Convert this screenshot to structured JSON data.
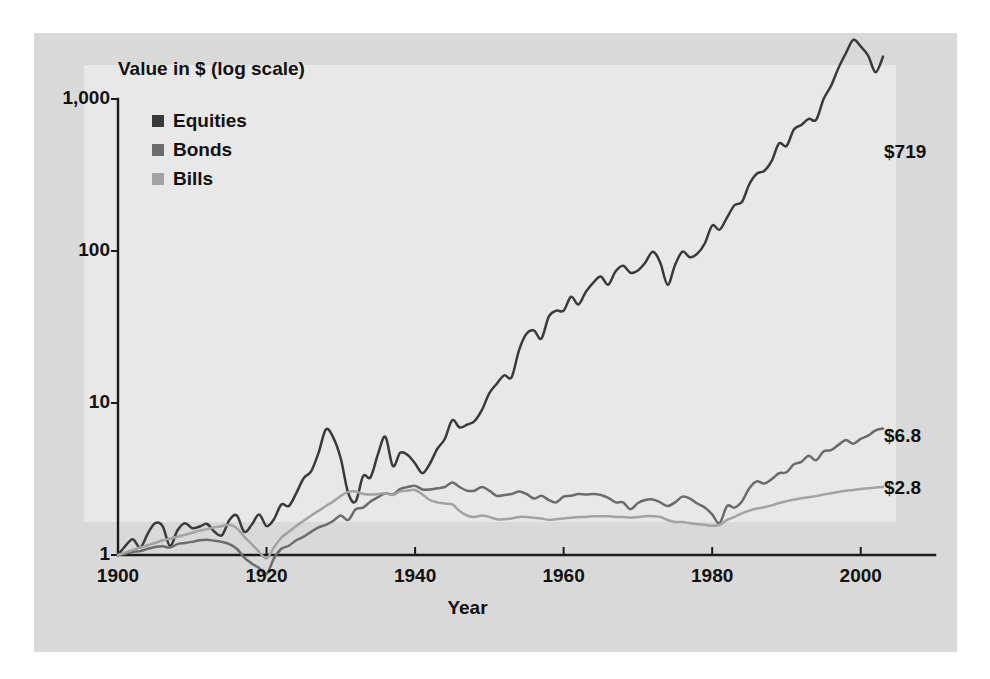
{
  "chart_data": {
    "type": "line",
    "title": "",
    "subtitle": "",
    "ylabel": "Value in $ (log scale)",
    "xlabel": "Year",
    "yscale": "log",
    "ylim": [
      1,
      1000
    ],
    "xlim": [
      1900,
      2010
    ],
    "grid": false,
    "legend_position": "top-left",
    "ytick_labels": [
      "1,000",
      "100",
      "10",
      "1"
    ],
    "ytick_values": [
      1000,
      100,
      10,
      1
    ],
    "xtick_labels": [
      "1900",
      "1920",
      "1940",
      "1960",
      "1980",
      "2000"
    ],
    "xtick_values": [
      1900,
      1920,
      1940,
      1960,
      1980,
      2000
    ],
    "annotations": [
      {
        "text": "$719",
        "series": "Equities",
        "x": 2003,
        "y": 719
      },
      {
        "text": "$6.8",
        "series": "Bonds",
        "x": 2003,
        "y": 6.8
      },
      {
        "text": "$2.8",
        "series": "Bills",
        "x": 2003,
        "y": 2.8
      }
    ],
    "colors": {
      "equities": "#3a3a3a",
      "bonds": "#6b6b6b",
      "bills": "#a3a3a3",
      "figure_background": "#d9d9d9",
      "plot_background": "#e8e8e8",
      "axis": "#1b1b1b",
      "text": "#111111"
    },
    "x": [
      1900,
      1901,
      1902,
      1903,
      1904,
      1905,
      1906,
      1907,
      1908,
      1909,
      1910,
      1911,
      1912,
      1913,
      1914,
      1915,
      1916,
      1917,
      1918,
      1919,
      1920,
      1921,
      1922,
      1923,
      1924,
      1925,
      1926,
      1927,
      1928,
      1929,
      1930,
      1931,
      1932,
      1933,
      1934,
      1935,
      1936,
      1937,
      1938,
      1939,
      1940,
      1941,
      1942,
      1943,
      1944,
      1945,
      1946,
      1947,
      1948,
      1949,
      1950,
      1951,
      1952,
      1953,
      1954,
      1955,
      1956,
      1957,
      1958,
      1959,
      1960,
      1961,
      1962,
      1963,
      1964,
      1965,
      1966,
      1967,
      1968,
      1969,
      1970,
      1971,
      1972,
      1973,
      1974,
      1975,
      1976,
      1977,
      1978,
      1979,
      1980,
      1981,
      1982,
      1983,
      1984,
      1985,
      1986,
      1987,
      1988,
      1989,
      1990,
      1991,
      1992,
      1993,
      1994,
      1995,
      1996,
      1997,
      1998,
      1999,
      2000,
      2001,
      2002,
      2003
    ],
    "series": [
      {
        "name": "Equities",
        "color": "#3a3a3a",
        "end_value": 719,
        "values": [
          1.0,
          1.15,
          1.27,
          1.12,
          1.38,
          1.62,
          1.55,
          1.15,
          1.45,
          1.62,
          1.5,
          1.54,
          1.6,
          1.42,
          1.35,
          1.7,
          1.82,
          1.42,
          1.58,
          1.85,
          1.55,
          1.72,
          2.15,
          2.1,
          2.55,
          3.2,
          3.55,
          4.7,
          6.7,
          5.9,
          4.3,
          2.55,
          2.25,
          3.3,
          3.25,
          4.6,
          6.0,
          3.85,
          4.7,
          4.55,
          4.0,
          3.45,
          4.0,
          5.0,
          5.8,
          7.7,
          6.9,
          7.2,
          7.6,
          9.0,
          11.6,
          13.4,
          15.2,
          14.8,
          22.3,
          28.5,
          30.0,
          26.5,
          37.0,
          40.5,
          40.5,
          50.0,
          44.5,
          54.0,
          62.0,
          68.0,
          60.0,
          73.5,
          80.0,
          72.0,
          74.5,
          84.0,
          99.0,
          84.0,
          60.0,
          81.0,
          99.0,
          91.0,
          96.0,
          112.0,
          147.0,
          138.0,
          166.0,
          200.0,
          210.0,
          275.0,
          322.0,
          336.0,
          390.0,
          510.0,
          490.0,
          630.0,
          675.0,
          740.0,
          730.0,
          1000.0,
          1220.0,
          1600.0,
          2000.0,
          2450.0,
          2220.0,
          1930.0,
          1500.0,
          1900.0
        ]
      },
      {
        "name": "Bonds",
        "color": "#6b6b6b",
        "end_value": 6.8,
        "values": [
          1.0,
          1.02,
          1.05,
          1.06,
          1.1,
          1.13,
          1.14,
          1.12,
          1.18,
          1.2,
          1.22,
          1.25,
          1.26,
          1.24,
          1.22,
          1.18,
          1.1,
          0.96,
          0.88,
          0.82,
          0.75,
          0.95,
          1.1,
          1.15,
          1.25,
          1.32,
          1.42,
          1.52,
          1.58,
          1.68,
          1.82,
          1.7,
          2.0,
          2.05,
          2.25,
          2.4,
          2.55,
          2.5,
          2.72,
          2.8,
          2.85,
          2.7,
          2.7,
          2.75,
          2.8,
          3.0,
          2.8,
          2.65,
          2.65,
          2.8,
          2.65,
          2.45,
          2.48,
          2.52,
          2.62,
          2.52,
          2.35,
          2.45,
          2.3,
          2.22,
          2.42,
          2.45,
          2.52,
          2.5,
          2.52,
          2.48,
          2.38,
          2.22,
          2.22,
          2.0,
          2.2,
          2.3,
          2.32,
          2.22,
          2.1,
          2.22,
          2.42,
          2.35,
          2.18,
          2.05,
          1.85,
          1.62,
          2.1,
          2.05,
          2.25,
          2.75,
          3.05,
          2.95,
          3.15,
          3.45,
          3.5,
          3.95,
          4.1,
          4.5,
          4.2,
          4.8,
          4.9,
          5.3,
          5.7,
          5.4,
          5.8,
          6.1,
          6.6,
          6.8
        ]
      },
      {
        "name": "Bills",
        "color": "#a3a3a3",
        "end_value": 2.8,
        "values": [
          1.0,
          1.04,
          1.08,
          1.12,
          1.16,
          1.2,
          1.25,
          1.28,
          1.32,
          1.36,
          1.4,
          1.45,
          1.48,
          1.52,
          1.55,
          1.58,
          1.5,
          1.32,
          1.18,
          1.05,
          0.95,
          1.12,
          1.3,
          1.42,
          1.55,
          1.68,
          1.82,
          1.95,
          2.1,
          2.25,
          2.45,
          2.6,
          2.62,
          2.52,
          2.5,
          2.52,
          2.55,
          2.48,
          2.62,
          2.65,
          2.68,
          2.5,
          2.3,
          2.22,
          2.18,
          2.15,
          1.95,
          1.82,
          1.78,
          1.82,
          1.78,
          1.72,
          1.72,
          1.74,
          1.78,
          1.78,
          1.76,
          1.74,
          1.7,
          1.72,
          1.74,
          1.76,
          1.78,
          1.78,
          1.8,
          1.8,
          1.8,
          1.78,
          1.78,
          1.76,
          1.78,
          1.8,
          1.8,
          1.78,
          1.7,
          1.65,
          1.65,
          1.62,
          1.6,
          1.58,
          1.56,
          1.58,
          1.7,
          1.78,
          1.88,
          1.96,
          2.02,
          2.06,
          2.12,
          2.2,
          2.26,
          2.32,
          2.36,
          2.4,
          2.44,
          2.5,
          2.55,
          2.6,
          2.65,
          2.68,
          2.72,
          2.75,
          2.78,
          2.8
        ]
      }
    ]
  },
  "legend": {
    "items": [
      {
        "label": "Equities",
        "color": "#3a3a3a"
      },
      {
        "label": "Bonds",
        "color": "#6b6b6b"
      },
      {
        "label": "Bills",
        "color": "#a3a3a3"
      }
    ]
  },
  "axes": {
    "y_title": "Value in $ (log scale)",
    "x_title": "Year",
    "y_ticks": [
      "1,000",
      "100",
      "10",
      "1"
    ],
    "x_ticks": [
      "1900",
      "1920",
      "1940",
      "1960",
      "1980",
      "2000"
    ]
  },
  "end_labels": {
    "equities": "$719",
    "bonds": "$6.8",
    "bills": "$2.8"
  }
}
